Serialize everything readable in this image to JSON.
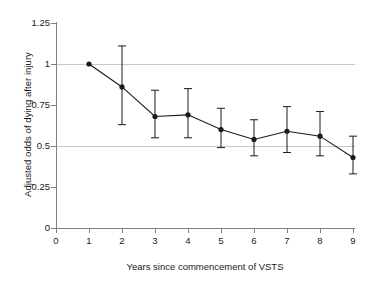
{
  "chart_data": {
    "type": "line",
    "title": "",
    "xlabel": "Years since commencement of VSTS",
    "ylabel": "Adjusted odds of dying after injury",
    "x": [
      1,
      2,
      3,
      4,
      5,
      6,
      7,
      8,
      9
    ],
    "values": [
      1.0,
      0.86,
      0.68,
      0.69,
      0.6,
      0.54,
      0.59,
      0.56,
      0.43
    ],
    "error_low": [
      1.0,
      0.63,
      0.55,
      0.55,
      0.49,
      0.44,
      0.46,
      0.44,
      0.33
    ],
    "error_high": [
      1.0,
      1.11,
      0.84,
      0.85,
      0.73,
      0.66,
      0.74,
      0.71,
      0.56
    ],
    "xlim": [
      0,
      9.6
    ],
    "ylim": [
      0,
      1.25
    ],
    "xticks": [
      "0",
      "1",
      "2",
      "3",
      "4",
      "5",
      "6",
      "7",
      "8",
      "9"
    ],
    "yticks": [
      "0",
      "0.25",
      "0.5",
      "0.75",
      "1",
      "1.25"
    ],
    "grid": "horizontal gridlines at 0.5 and 1.0",
    "gridlines": [
      0.5,
      1.0
    ],
    "legend": "none",
    "marker": "filled circle",
    "series_color": "#1a1a1a",
    "grid_color": "#c8c8c8",
    "axis_color": "#808080"
  }
}
